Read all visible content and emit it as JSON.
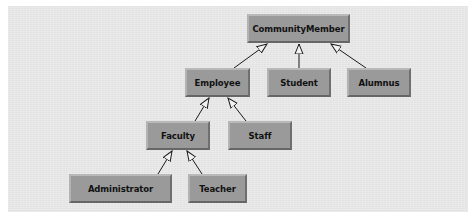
{
  "diagram": {
    "type": "class-inheritance-hierarchy",
    "colors": {
      "background": "#e9e9e9",
      "node_fill": "#9a9a9a",
      "node_text": "#111111",
      "edge": "#1a1a1a"
    },
    "nodes": {
      "community_member": {
        "label": "CommunityMember"
      },
      "employee": {
        "label": "Employee"
      },
      "student": {
        "label": "Student"
      },
      "alumnus": {
        "label": "Alumnus"
      },
      "faculty": {
        "label": "Faculty"
      },
      "staff": {
        "label": "Staff"
      },
      "administrator": {
        "label": "Administrator"
      },
      "teacher": {
        "label": "Teacher"
      }
    },
    "edges": [
      {
        "from": "Employee",
        "to": "CommunityMember",
        "kind": "generalization"
      },
      {
        "from": "Student",
        "to": "CommunityMember",
        "kind": "generalization"
      },
      {
        "from": "Alumnus",
        "to": "CommunityMember",
        "kind": "generalization"
      },
      {
        "from": "Faculty",
        "to": "Employee",
        "kind": "generalization"
      },
      {
        "from": "Staff",
        "to": "Employee",
        "kind": "generalization"
      },
      {
        "from": "Administrator",
        "to": "Faculty",
        "kind": "generalization"
      },
      {
        "from": "Teacher",
        "to": "Faculty",
        "kind": "generalization"
      }
    ]
  }
}
